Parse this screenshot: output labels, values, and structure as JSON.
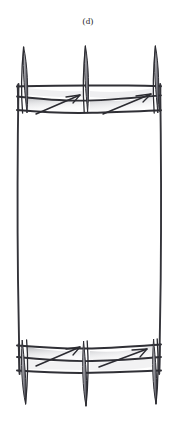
{
  "figure": {
    "caption": "(d)",
    "kind": "hand-drawn-technical-sketch",
    "canvas": {
      "width": 176,
      "height": 444,
      "background": "#ffffff"
    },
    "colors": {
      "ink": "#2b2b30",
      "ink_light": "#4a4a52",
      "shading": "#b9b9bd",
      "shading_pale": "#d8d8dc",
      "background": "#ffffff"
    },
    "assembly": {
      "top_group_label": "top-post-group",
      "bottom_group_label": "bottom-post-group",
      "post_count_per_group": 3,
      "rail_count_per_group": 3,
      "arrow_count_per_group": 2
    },
    "top_posts": [
      {
        "name": "top-post-left",
        "cx": 24,
        "top": 47,
        "bottom": 114,
        "half_width": 6
      },
      {
        "name": "top-post-center",
        "cx": 85,
        "top": 46,
        "bottom": 112,
        "half_width": 6
      },
      {
        "name": "top-post-right",
        "cx": 155,
        "top": 46,
        "bottom": 113,
        "half_width": 6
      }
    ],
    "bottom_posts": [
      {
        "name": "bottom-post-left",
        "cx": 24,
        "top": 340,
        "bottom": 404,
        "half_width": 6
      },
      {
        "name": "bottom-post-center",
        "cx": 85,
        "top": 341,
        "bottom": 406,
        "half_width": 6
      },
      {
        "name": "bottom-post-right",
        "cx": 155,
        "top": 339,
        "bottom": 404,
        "half_width": 6
      }
    ],
    "side_rails": [
      {
        "name": "side-rail-left",
        "x_top": 18,
        "y_top": 85,
        "x_bottom": 19,
        "y_bottom": 371
      },
      {
        "name": "side-rail-right",
        "x_top": 160,
        "y_top": 85,
        "x_bottom": 161,
        "y_bottom": 371
      }
    ],
    "top_rails": [
      {
        "name": "top-rail-upper",
        "y": 86
      },
      {
        "name": "top-rail-middle",
        "y": 100
      },
      {
        "name": "top-rail-lower",
        "y": 113
      }
    ],
    "bottom_rails": [
      {
        "name": "bottom-rail-upper",
        "y": 345
      },
      {
        "name": "bottom-rail-middle",
        "y": 358
      },
      {
        "name": "bottom-rail-lower",
        "y": 372
      }
    ],
    "arrows": [
      {
        "name": "arrow-top-left",
        "x1": 38,
        "y1": 113,
        "x2": 80,
        "y2": 95,
        "direction": "up-right"
      },
      {
        "name": "arrow-top-right",
        "x1": 104,
        "y1": 113,
        "x2": 150,
        "y2": 94,
        "direction": "up-right"
      },
      {
        "name": "arrow-bottom-left",
        "x1": 37,
        "y1": 365,
        "x2": 80,
        "y2": 347,
        "direction": "up-right"
      },
      {
        "name": "arrow-bottom-right",
        "x1": 100,
        "y1": 366,
        "x2": 146,
        "y2": 349,
        "direction": "up-right"
      }
    ],
    "shaded_panels": [
      {
        "name": "shaded-panel-top-left",
        "x": 26,
        "y": 96,
        "width": 56,
        "height": 14
      },
      {
        "name": "shaded-panel-top-right",
        "x": 90,
        "y": 95,
        "width": 62,
        "height": 14
      },
      {
        "name": "shaded-panel-bottom-left",
        "x": 26,
        "y": 347,
        "width": 56,
        "height": 13
      },
      {
        "name": "shaded-panel-bottom-right",
        "x": 90,
        "y": 346,
        "width": 62,
        "height": 13
      }
    ]
  }
}
